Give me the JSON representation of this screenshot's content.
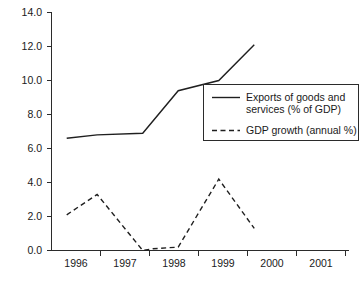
{
  "chart_data": {
    "type": "line",
    "title": "",
    "subtitle": "",
    "xlabel": "",
    "ylabel": "",
    "grid": false,
    "legend_position": "center-right",
    "x_tick_labels": [
      "1996",
      "1997",
      "1998",
      "1999",
      "2000",
      "2001"
    ],
    "y_tick_labels": [
      "0.0",
      "2.0",
      "4.0",
      "6.0",
      "8.0",
      "10.0",
      "12.0",
      "14.0"
    ],
    "y_ticks": [
      0.0,
      2.0,
      4.0,
      6.0,
      8.0,
      10.0,
      12.0,
      14.0
    ],
    "ylim": [
      0.0,
      14.0
    ],
    "xlim": [
      1995.6,
      2001.4
    ],
    "series": [
      {
        "name": "Exports of goods and services (% of GDP)",
        "style": "solid",
        "color": "#1f1f1f",
        "x": [
          1995.9,
          1996.5,
          1997.4,
          1998.1,
          1998.9,
          1999.6
        ],
        "values": [
          6.6,
          6.8,
          6.9,
          9.4,
          10.0,
          12.1
        ]
      },
      {
        "name": "GDP growth (annual %)",
        "style": "dashed",
        "color": "#1f1f1f",
        "x": [
          1995.9,
          1996.5,
          1997.4,
          1997.6,
          1998.1,
          1998.9,
          1999.6
        ],
        "values": [
          2.1,
          3.3,
          0.0,
          0.1,
          0.2,
          4.2,
          1.3
        ]
      }
    ],
    "legend_entries": [
      {
        "style": "solid",
        "line1": "Exports of goods and",
        "line2": "services (% of GDP)",
        "full": "Exports of goods and services (% of GDP)"
      },
      {
        "style": "dashed",
        "line1": "GDP growth (annual %)",
        "line2": "",
        "full": "GDP growth (annual %)"
      }
    ]
  },
  "axis": {
    "y_labels": [
      "14.0",
      "12.0",
      "10.0",
      "8.0",
      "6.0",
      "4.0",
      "2.0",
      "0.0"
    ],
    "x_labels": [
      "1996",
      "1997",
      "1998",
      "1999",
      "2000",
      "2001"
    ]
  },
  "colors": {
    "axis": "#2b2b2b",
    "series": "#1f1f1f",
    "background": "#ffffff",
    "text": "#1a1a1a"
  }
}
